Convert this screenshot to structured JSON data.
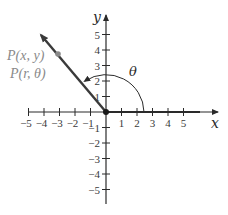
{
  "diagram": {
    "type": "polar-coordinate-angle",
    "x_axis": {
      "label": "x",
      "ticks": [
        "−5",
        "−4",
        "−3",
        "−2",
        "−1",
        "1",
        "2",
        "3",
        "4",
        "5"
      ]
    },
    "y_axis": {
      "label": "y",
      "ticks_positive": [
        "1",
        "2",
        "3",
        "4",
        "5"
      ],
      "ticks_negative": [
        "−1",
        "−2",
        "−3",
        "−4",
        "−5"
      ]
    },
    "point": {
      "label_cartesian": "P(x, y)",
      "label_polar": "P(r, θ)"
    },
    "angle": {
      "label": "θ"
    },
    "colors": {
      "axis": "#2a2a2a",
      "ray": "#3a3a3a",
      "point": "#8a8a8a",
      "label_gray": "#8a8a8a"
    }
  }
}
